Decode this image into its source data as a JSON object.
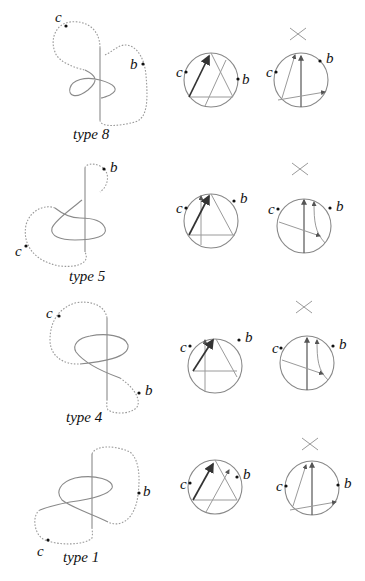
{
  "figure": {
    "rows": [
      {
        "type_label": "type 8",
        "point_labels": {
          "c": "c",
          "b": "b"
        }
      },
      {
        "type_label": "type 5",
        "point_labels": {
          "c": "c",
          "b": "b"
        }
      },
      {
        "type_label": "type 4",
        "point_labels": {
          "c": "c",
          "b": "b"
        }
      },
      {
        "type_label": "type 1",
        "point_labels": {
          "c": "c",
          "b": "b"
        }
      }
    ],
    "panels_per_row": [
      "knot-diagram",
      "chord-diagram-triangle",
      "chord-diagram-after-crossing-change"
    ],
    "crossing_symbol": "crossing-change-icon"
  }
}
